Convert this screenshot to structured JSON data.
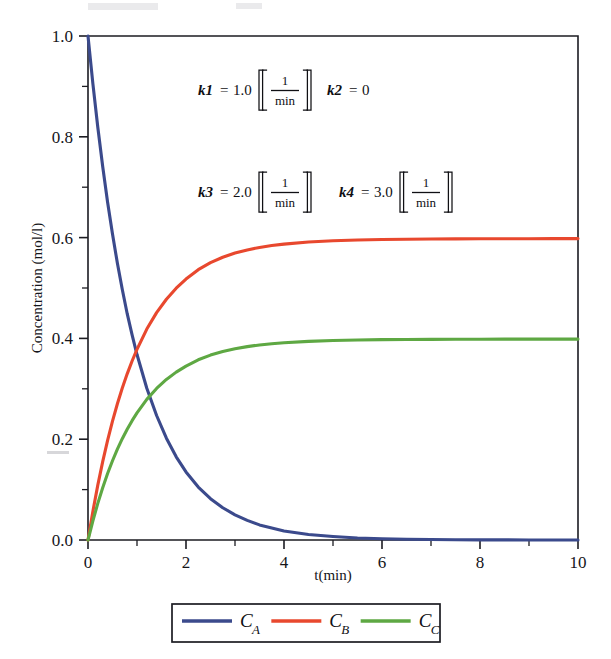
{
  "figure": {
    "background_color": "#ffffff",
    "frame_color": "#1c1c22"
  },
  "chart_data": {
    "type": "line",
    "title": "",
    "xlabel": "t(min)",
    "ylabel": "Concentration (mol/l)",
    "xlim": [
      0,
      10
    ],
    "ylim": [
      0,
      1.0
    ],
    "xticks": [
      0,
      2,
      4,
      6,
      8,
      10
    ],
    "xtick_labels": [
      "0",
      "2",
      "4",
      "6",
      "8",
      "10"
    ],
    "xminor_ticks": [
      1,
      3,
      5,
      7,
      9
    ],
    "yticks": [
      0.0,
      0.2,
      0.4,
      0.6,
      0.8,
      1.0
    ],
    "ytick_labels": [
      "0.0",
      "0.2",
      "0.4",
      "0.6",
      "0.8",
      "1.0"
    ],
    "yminor_ticks": [
      0.1,
      0.3,
      0.5,
      0.7,
      0.9
    ],
    "grid": false,
    "legend_position": "below-axes",
    "x": [
      0,
      0.1,
      0.2,
      0.3,
      0.4,
      0.5,
      0.6,
      0.7,
      0.8,
      0.9,
      1.0,
      1.2,
      1.4,
      1.6,
      1.8,
      2.0,
      2.25,
      2.5,
      2.75,
      3.0,
      3.25,
      3.5,
      3.75,
      4.0,
      4.5,
      5.0,
      5.5,
      6.0,
      6.5,
      7.0,
      7.5,
      8.0,
      8.5,
      9.0,
      9.5,
      10.0
    ],
    "series": [
      {
        "name": "C_A",
        "label": "C",
        "subscript": "A",
        "color": "#3b4a8c",
        "plateau": 0.01,
        "values": [
          1.0,
          0.905,
          0.819,
          0.741,
          0.67,
          0.607,
          0.549,
          0.497,
          0.449,
          0.407,
          0.368,
          0.301,
          0.247,
          0.202,
          0.165,
          0.135,
          0.105,
          0.082,
          0.064,
          0.05,
          0.039,
          0.03,
          0.024,
          0.018,
          0.011,
          0.007,
          0.004,
          0.0025,
          0.0015,
          0.001,
          0.0006,
          0.0003,
          0.0002,
          0.0001,
          0.0001,
          0.0
        ]
      },
      {
        "name": "C_B",
        "label": "C",
        "subscript": "B",
        "color": "#e8482e",
        "plateau": 0.605,
        "values": [
          0.0,
          0.0572,
          0.1089,
          0.1555,
          0.1977,
          0.2358,
          0.2703,
          0.3015,
          0.3297,
          0.3552,
          0.3783,
          0.4185,
          0.4511,
          0.4777,
          0.4996,
          0.5177,
          0.5363,
          0.5504,
          0.5611,
          0.5693,
          0.5756,
          0.5805,
          0.5842,
          0.5871,
          0.5912,
          0.5937,
          0.5952,
          0.5962,
          0.5968,
          0.5971,
          0.5974,
          0.5976,
          0.5977,
          0.5978,
          0.5979,
          0.598
        ]
      },
      {
        "name": "C_C",
        "label": "C",
        "subscript": "C",
        "color": "#5ea843",
        "plateau": 0.405,
        "values": [
          0.0,
          0.0381,
          0.0726,
          0.1037,
          0.1318,
          0.1572,
          0.1802,
          0.201,
          0.2198,
          0.2368,
          0.2522,
          0.279,
          0.3007,
          0.3185,
          0.3331,
          0.3451,
          0.3575,
          0.3669,
          0.3741,
          0.3795,
          0.3837,
          0.387,
          0.3895,
          0.3914,
          0.3941,
          0.3958,
          0.3968,
          0.3975,
          0.3979,
          0.3981,
          0.3983,
          0.3984,
          0.3985,
          0.3985,
          0.3986,
          0.3986
        ]
      }
    ],
    "annotations": [
      {
        "name": "rate-constants-line-1",
        "items": [
          {
            "symbol": "k1",
            "equals": "=",
            "value": "1.0",
            "unit_numerator": "1",
            "unit_denominator": "min",
            "has_unit": true
          },
          {
            "symbol": "k2",
            "equals": "=",
            "value": "0",
            "unit_numerator": "",
            "unit_denominator": "",
            "has_unit": false
          }
        ]
      },
      {
        "name": "rate-constants-line-2",
        "items": [
          {
            "symbol": "k3",
            "equals": "=",
            "value": "2.0",
            "unit_numerator": "1",
            "unit_denominator": "min",
            "has_unit": true
          },
          {
            "symbol": "k4",
            "equals": "=",
            "value": "3.0",
            "unit_numerator": "1",
            "unit_denominator": "min",
            "has_unit": true
          }
        ]
      }
    ]
  }
}
